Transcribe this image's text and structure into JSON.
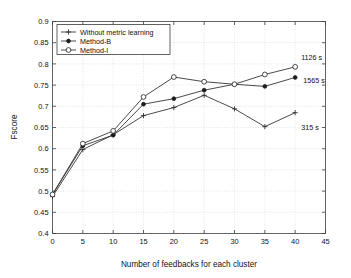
{
  "chart_data": {
    "type": "line",
    "title": "",
    "xlabel": "Number of feedbacks for each cluster",
    "ylabel": "Fscore",
    "xlim": [
      0,
      45
    ],
    "ylim": [
      0.4,
      0.9
    ],
    "xticks": [
      "0",
      "5",
      "10",
      "15",
      "20",
      "25",
      "30",
      "35",
      "40",
      "45"
    ],
    "xtick_values": [
      0,
      5,
      10,
      15,
      20,
      25,
      30,
      35,
      40,
      45
    ],
    "yticks": [
      "0.4",
      "0.45",
      "0.5",
      "0.55",
      "0.6",
      "0.65",
      "0.7",
      "0.75",
      "0.8",
      "0.85",
      "0.9"
    ],
    "ytick_values": [
      0.4,
      0.45,
      0.5,
      0.55,
      0.6,
      0.65,
      0.7,
      0.75,
      0.8,
      0.85,
      0.9
    ],
    "grid": true,
    "legend_position": "upper left",
    "x": [
      0,
      5,
      10,
      15,
      20,
      25,
      30,
      35,
      40
    ],
    "series": [
      {
        "name": "Without metric learning",
        "marker": "plus",
        "values": [
          0.487,
          0.598,
          0.633,
          0.678,
          0.697,
          0.726,
          0.694,
          0.652,
          0.685
        ]
      },
      {
        "name": "Method-B",
        "marker": "filled-circle",
        "values": [
          0.492,
          0.607,
          0.632,
          0.705,
          0.718,
          0.738,
          0.752,
          0.747,
          0.768
        ]
      },
      {
        "name": "Method-I",
        "marker": "open-circle",
        "values": [
          0.492,
          0.612,
          0.642,
          0.722,
          0.769,
          0.758,
          0.752,
          0.775,
          0.793
        ]
      }
    ],
    "annotations": [
      {
        "text": "1126 s",
        "series": "Method-I",
        "x": 40,
        "y": 0.793
      },
      {
        "text": "1565 s",
        "series": "Method-B",
        "x": 40,
        "y": 0.768
      },
      {
        "text": "315 s",
        "series": "Without metric learning",
        "x": 40,
        "y": 0.685
      }
    ]
  },
  "legend": {
    "items": [
      {
        "label": "Without metric learning"
      },
      {
        "label": "Method-B"
      },
      {
        "label": "Method-I"
      }
    ]
  },
  "colors": {
    "line": "#2a2a2a",
    "grid": "#c9c9c9",
    "axis": "#3c3c3c",
    "background": "#ffffff"
  }
}
